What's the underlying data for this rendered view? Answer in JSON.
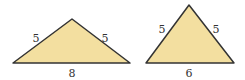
{
  "triangles": [
    {
      "name": "wide-isosceles",
      "sides": {
        "left": "5",
        "right": "5",
        "base": "8"
      },
      "points": [
        [
          13,
          63
        ],
        [
          72,
          19
        ],
        [
          130,
          63
        ]
      ],
      "label_pos": {
        "left": [
          36,
          42
        ],
        "right": [
          105,
          42
        ],
        "base": [
          72,
          77
        ]
      }
    },
    {
      "name": "tall-isosceles",
      "sides": {
        "left": "5",
        "right": "5",
        "base": "6"
      },
      "points": [
        [
          146,
          63
        ],
        [
          189,
          5
        ],
        [
          234,
          63
        ]
      ],
      "label_pos": {
        "left": [
          162,
          33
        ],
        "right": [
          216,
          33
        ],
        "base": [
          189,
          77
        ]
      }
    }
  ],
  "colors": {
    "fill": "#f3dfa0",
    "stroke": "#333333"
  }
}
